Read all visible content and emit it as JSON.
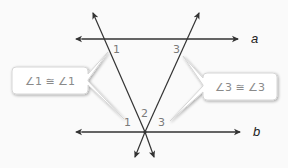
{
  "diagram": {
    "type": "parallel-lines-with-transversals",
    "lines": {
      "a": {
        "label": "a"
      },
      "b": {
        "label": "b"
      }
    },
    "angle_labels": {
      "top_left": "1",
      "top_right": "3",
      "bottom_left": "1",
      "bottom_middle": "2",
      "bottom_right": "3"
    },
    "callouts": {
      "left": {
        "text": "∠1 ≅ ∠1"
      },
      "right": {
        "text": "∠3 ≅ ∠3"
      }
    },
    "colors": {
      "line": "#333333",
      "angle_label": "#7a7a7a",
      "callout_border": "#d6d6d6",
      "callout_fill": "#ffffff",
      "background": "#fafafa"
    }
  }
}
